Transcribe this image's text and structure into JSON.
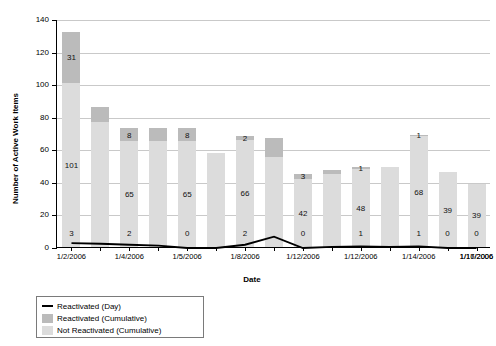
{
  "chart_data": {
    "type": "bar",
    "title": "",
    "xlabel": "Date",
    "ylabel": "Number of Active Work Items",
    "ylim": [
      0,
      140
    ],
    "ytick_step": 20,
    "yticks": [
      "0",
      "20",
      "40",
      "60",
      "80",
      "100",
      "120",
      "140"
    ],
    "grid": true,
    "legend_position": "bottom-left",
    "categories": [
      "1/2/2006",
      "1/3/2006",
      "1/4/2006",
      "1/4/2006",
      "1/5/2006",
      "1/6/2006",
      "1/8/2006",
      "1/9/2006",
      "1/12/2006",
      "1/12/2006",
      "1/12/2006",
      "1/13/2006",
      "1/14/2006",
      "1/16/2006",
      "1/17/2006"
    ],
    "xtick_labels": [
      "1/2/2006",
      "1/4/2006",
      "1/5/2006",
      "1/8/2006",
      "1/12/2006",
      "1/12/2006",
      "1/14/2006",
      "1/16/2006",
      "1/17/2006"
    ],
    "series": [
      {
        "name": "Not Reactivated (Cumulative)",
        "color": "#dcdcdc",
        "values": [
          101,
          77,
          65,
          65,
          65,
          58,
          66,
          55,
          42,
          45,
          48,
          49,
          68,
          46,
          39
        ]
      },
      {
        "name": "Reactivated (Cumulative)",
        "color": "#bbbbbb",
        "values": [
          31,
          9,
          8,
          8,
          8,
          0,
          2,
          12,
          3,
          2,
          1,
          0,
          1,
          0,
          0
        ]
      },
      {
        "name": "Reactivated (Day)",
        "color": "#000000",
        "values": [
          3,
          2.6,
          2,
          1.4,
          0,
          0,
          2,
          7,
          0,
          0.7,
          1,
          0.6,
          1,
          0,
          0
        ]
      }
    ],
    "bar_value_labels_bottom": [
      "3",
      "",
      "2",
      "",
      "0",
      "",
      "2",
      "",
      "0",
      "",
      "1",
      "",
      "1",
      "0",
      "0"
    ],
    "bar_value_labels_light": [
      "101",
      "",
      "65",
      "",
      "65",
      "",
      "66",
      "",
      "42",
      "",
      "48",
      "",
      "68",
      "39",
      "39"
    ],
    "bar_value_labels_dark": [
      "31",
      "",
      "8",
      "",
      "8",
      "",
      "2",
      "",
      "3",
      "",
      "1",
      "",
      "1",
      "",
      ""
    ]
  },
  "legend": {
    "items": [
      {
        "label": "Reactivated (Day)",
        "type": "line",
        "color": "#000000"
      },
      {
        "label": "Reactivated (Cumulative)",
        "type": "swatch",
        "color": "#bbbbbb"
      },
      {
        "label": "Not Reactivated (Cumulative)",
        "type": "swatch",
        "color": "#dcdcdc"
      }
    ]
  }
}
